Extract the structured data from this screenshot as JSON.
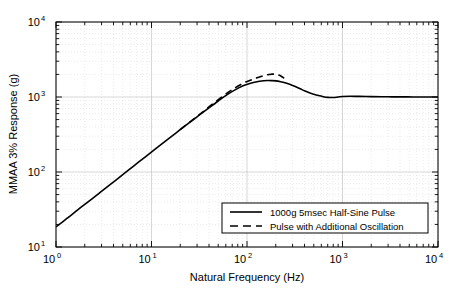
{
  "chart_data": {
    "type": "line",
    "title": "",
    "xlabel": "Natural Frequency (Hz)",
    "ylabel": "MMAA 3% Response (g)",
    "xscale": "log",
    "yscale": "log",
    "xlim": [
      1,
      10000
    ],
    "ylim": [
      10,
      10000
    ],
    "grid": true,
    "grid_minor": true,
    "legend_position": "lower right",
    "xticklabels": [
      "10^0",
      "10^1",
      "10^2",
      "10^3",
      "10^4"
    ],
    "xtickvalues": [
      1,
      10,
      100,
      1000,
      10000
    ],
    "xtick_base": "10",
    "xtick_exponents": [
      "0",
      "1",
      "2",
      "3",
      "4"
    ],
    "yticklabels": [
      "10^1",
      "10^2",
      "10^3",
      "10^4"
    ],
    "ytickvalues": [
      10,
      100,
      1000,
      10000
    ],
    "ytick_base": "10",
    "ytick_exponents": [
      "1",
      "2",
      "3",
      "4"
    ],
    "series": [
      {
        "name": "1000g 5msec Half-Sine Pulse",
        "style": "solid",
        "color": "#000000",
        "linewidth": 1.6,
        "x": [
          1,
          1.3,
          1.7,
          2.2,
          2.9,
          3.8,
          5.0,
          6.5,
          8.5,
          11,
          14,
          18,
          23,
          30,
          39,
          50,
          62,
          75,
          90,
          105,
          120,
          135,
          150,
          165,
          180,
          200,
          225,
          250,
          280,
          320,
          360,
          400,
          450,
          500,
          560,
          630,
          700,
          800,
          900,
          1000,
          1200,
          1500,
          2000,
          2600,
          3300,
          4200,
          5500,
          7000,
          8500,
          10000
        ],
        "y": [
          18.5,
          24,
          31.5,
          40.5,
          53.5,
          70,
          92,
          120,
          157,
          203,
          258,
          331,
          421,
          545,
          700,
          885,
          1075,
          1245,
          1400,
          1500,
          1570,
          1620,
          1650,
          1660,
          1655,
          1640,
          1600,
          1550,
          1480,
          1380,
          1290,
          1210,
          1140,
          1090,
          1045,
          1010,
          990,
          985,
          1000,
          1015,
          1022,
          1018,
          1012,
          1008,
          1005,
          1003,
          1002,
          1001,
          1000,
          1000
        ]
      },
      {
        "name": "Pulse with Additional Oscillation",
        "style": "dashed",
        "color": "#000000",
        "linewidth": 1.6,
        "x": [
          20,
          26,
          34,
          44,
          57,
          74,
          95,
          110,
          125,
          140,
          155,
          170,
          185,
          200,
          215,
          230,
          245
        ],
        "y": [
          368,
          478,
          625,
          815,
          1045,
          1310,
          1560,
          1680,
          1790,
          1880,
          1950,
          2000,
          2020,
          2010,
          1960,
          1880,
          1780
        ]
      }
    ],
    "legend_entries": [
      {
        "label": "1000g 5msec Half-Sine Pulse",
        "style": "solid"
      },
      {
        "label": "Pulse with Additional Oscillation",
        "style": "dashed"
      }
    ]
  },
  "axes": {
    "xlabel": "Natural Frequency (Hz)",
    "ylabel": "MMAA 3% Response (g)"
  }
}
